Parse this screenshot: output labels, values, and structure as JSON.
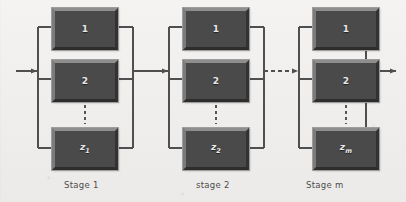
{
  "figure": {
    "title": "",
    "type": "block-diagram",
    "background_color": "#f2f1ef",
    "block_fill_color": "#4a4a4a",
    "block_label_color": "#e9e9e9",
    "wire_color": "#4f4f4f",
    "caption_color": "#4c4c4c"
  },
  "stages": [
    {
      "caption": "Stage 1",
      "blocks": [
        {
          "label": "1",
          "sub": ""
        },
        {
          "label": "2",
          "sub": ""
        },
        {
          "label": "z",
          "sub": "1"
        }
      ],
      "ellipsis": "vertical-dots"
    },
    {
      "caption": "stage 2",
      "blocks": [
        {
          "label": "1",
          "sub": ""
        },
        {
          "label": "2",
          "sub": ""
        },
        {
          "label": "z",
          "sub": "2"
        }
      ],
      "ellipsis": "vertical-dots"
    },
    {
      "caption": "Stage m",
      "blocks": [
        {
          "label": "1",
          "sub": ""
        },
        {
          "label": "2",
          "sub": ""
        },
        {
          "label": "z",
          "sub": "m"
        }
      ],
      "ellipsis": "vertical-dots"
    }
  ],
  "connectors": [
    {
      "name": "input-arrow",
      "style": "solid",
      "direction": "right"
    },
    {
      "name": "stage1-to-stage2",
      "style": "solid",
      "direction": "right"
    },
    {
      "name": "stage2-to-stagem",
      "style": "dashed",
      "direction": "right"
    },
    {
      "name": "output-arrow",
      "style": "solid",
      "direction": "right"
    }
  ]
}
